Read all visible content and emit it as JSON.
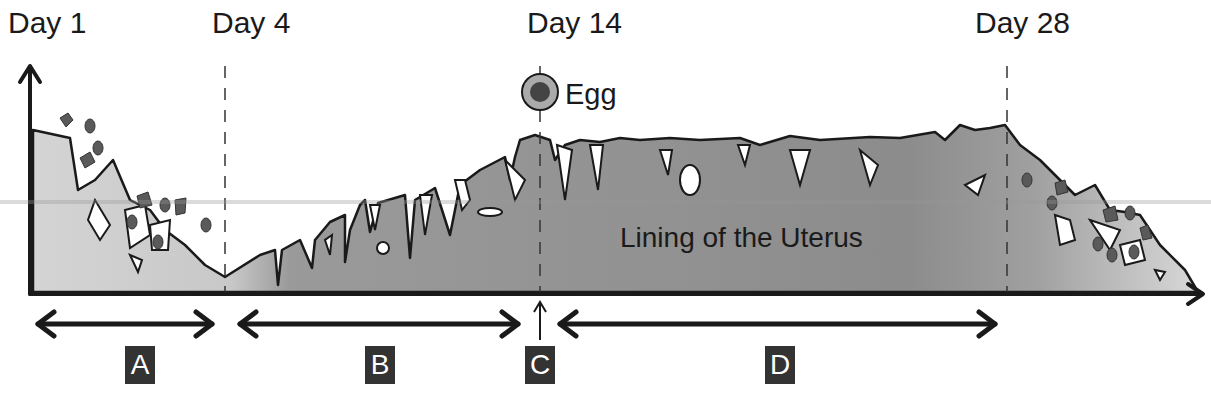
{
  "days": [
    {
      "label": "Day 1",
      "x": 8
    },
    {
      "label": "Day 4",
      "x": 212
    },
    {
      "label": "Day 14",
      "x": 527
    },
    {
      "label": "Day 28",
      "x": 975
    }
  ],
  "egg": {
    "label": "Egg"
  },
  "lining": {
    "label": "Lining of the Uterus"
  },
  "phases": [
    {
      "label": "A",
      "x": 125
    },
    {
      "label": "B",
      "x": 365
    },
    {
      "label": "C",
      "x": 525
    },
    {
      "label": "D",
      "x": 765
    }
  ],
  "colors": {
    "lining_dark": "#8a8a8a",
    "lining_light": "#cfcfcf",
    "outline": "#1a1a1a",
    "blood": "#5a5a5a",
    "phase_box": "#333333"
  }
}
